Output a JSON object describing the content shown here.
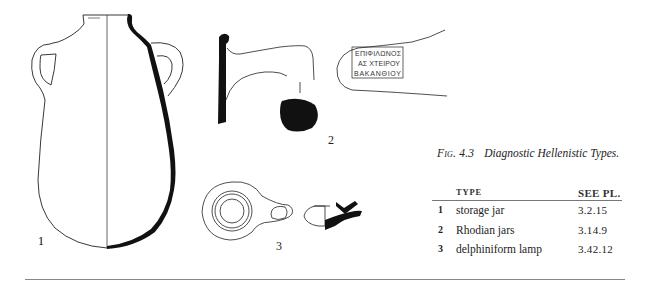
{
  "figure": {
    "number": "Fig. 4.3",
    "title": "Diagnostic Hellenistic Types.",
    "drawing_labels": [
      "1",
      "2",
      "3"
    ],
    "stamp_inscription": [
      "ΕΠΙΦΙΛΩΝΟΣ",
      "ΑΣ ΧΤΕΙΡΟΥ",
      "ΒΑΚΑΝΘΙΟΥ"
    ]
  },
  "table": {
    "headers": {
      "number": "",
      "type": "TYPE",
      "see_pl": "SEE PL."
    },
    "rows": [
      {
        "number": "1",
        "type": "storage jar",
        "see_pl": "3.2.15"
      },
      {
        "number": "2",
        "type": "Rhodian jars",
        "see_pl": "3.14.9"
      },
      {
        "number": "3",
        "type": "delphiniform lamp",
        "see_pl": "3.42.12"
      }
    ]
  },
  "colors": {
    "ink": "#111111",
    "rule": "#888888",
    "text": "#222222"
  }
}
